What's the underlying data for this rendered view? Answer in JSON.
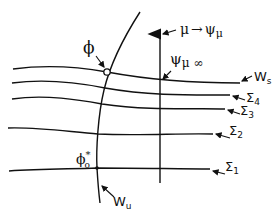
{
  "diagram": {
    "curves": [
      {
        "id": "Ws",
        "label": "W",
        "sub": "s"
      },
      {
        "id": "sigma4",
        "label": "Σ",
        "sub": "4"
      },
      {
        "id": "sigma3",
        "label": "Σ",
        "sub": "3"
      },
      {
        "id": "sigma2",
        "label": "Σ",
        "sub": "2"
      },
      {
        "id": "sigma1",
        "label": "Σ",
        "sub": "1"
      },
      {
        "id": "Wu",
        "label": "W",
        "sub": "u"
      }
    ],
    "points": {
      "phi": "ϕ",
      "phi0_star": {
        "base": "ϕ",
        "sub": "o",
        "sup": "*"
      }
    },
    "axis": {
      "label_mu": "μ",
      "arrow": "→",
      "label_psi_mu": "ψ",
      "psi_sub": "μ",
      "psi_mu_inf_base": "ψ",
      "psi_mu_inf_sub": "μ ∞"
    }
  }
}
